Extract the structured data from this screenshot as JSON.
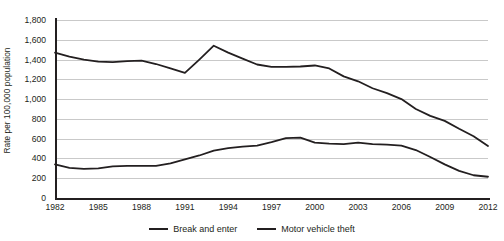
{
  "chart_data": {
    "type": "line",
    "title": "",
    "xlabel": "",
    "ylabel": "Rate per 100,000 population",
    "xlim": [
      1982,
      2012
    ],
    "ylim": [
      0,
      1800
    ],
    "grid": true,
    "legend_position": "bottom",
    "x": [
      1982,
      1983,
      1984,
      1985,
      1986,
      1987,
      1988,
      1989,
      1990,
      1991,
      1992,
      1993,
      1994,
      1995,
      1996,
      1997,
      1998,
      1999,
      2000,
      2001,
      2002,
      2003,
      2004,
      2005,
      2006,
      2007,
      2008,
      2009,
      2010,
      2011,
      2012
    ],
    "x_tick_labels": [
      "1982",
      "1985",
      "1988",
      "1991",
      "1994",
      "1997",
      "2000",
      "2003",
      "2006",
      "2009",
      "2012"
    ],
    "x_ticks": [
      1982,
      1985,
      1988,
      1991,
      1994,
      1997,
      2000,
      2003,
      2006,
      2009,
      2012
    ],
    "y_tick_labels": [
      "0",
      "200",
      "400",
      "600",
      "800",
      "1,000",
      "1,200",
      "1,400",
      "1,600",
      "1,800"
    ],
    "y_ticks": [
      0,
      200,
      400,
      600,
      800,
      1000,
      1200,
      1400,
      1600,
      1800
    ],
    "series": [
      {
        "name": "Break and enter",
        "color": "#231f20",
        "values": [
          1470,
          1430,
          1400,
          1380,
          1375,
          1385,
          1390,
          1355,
          1310,
          1265,
          1400,
          1540,
          1470,
          1410,
          1350,
          1325,
          1325,
          1330,
          1340,
          1310,
          1230,
          1180,
          1110,
          1060,
          1000,
          900,
          830,
          780,
          700,
          625,
          525
        ]
      },
      {
        "name": "Motor vehicle theft",
        "color": "#231f20",
        "values": [
          340,
          305,
          295,
          300,
          320,
          325,
          325,
          325,
          350,
          390,
          430,
          480,
          505,
          520,
          530,
          565,
          605,
          610,
          560,
          550,
          545,
          560,
          545,
          540,
          530,
          485,
          415,
          340,
          275,
          230,
          215
        ]
      }
    ]
  },
  "legend": {
    "items": [
      {
        "label": "Break and enter"
      },
      {
        "label": "Motor vehicle theft"
      }
    ]
  },
  "axes": {
    "y_title": "Rate per 100,000 population"
  }
}
